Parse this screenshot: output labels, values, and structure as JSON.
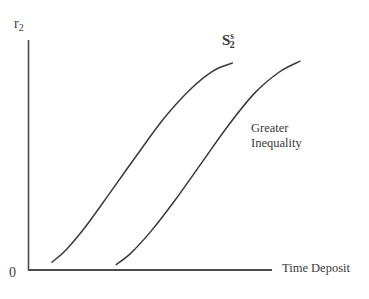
{
  "chart_data": {
    "type": "line",
    "title": "",
    "subtitle": "",
    "xlabel": "Time Deposit",
    "ylabel": "r",
    "ylabel_sub": "2",
    "origin_label": "0",
    "grid": false,
    "legend_position": "inline-annotation",
    "xlim": [
      0,
      100
    ],
    "ylim": [
      0,
      100
    ],
    "xticks": [],
    "yticks": [],
    "series": [
      {
        "name": "S",
        "name_sub": "2",
        "name_sup": "s",
        "label": "S2s",
        "color": "#3a3a3a",
        "points": [
          {
            "x": 8.2,
            "y": 3.5
          },
          {
            "x": 13.0,
            "y": 9.0
          },
          {
            "x": 20.0,
            "y": 20.0
          },
          {
            "x": 28.0,
            "y": 34.5
          },
          {
            "x": 37.0,
            "y": 51.0
          },
          {
            "x": 46.0,
            "y": 67.0
          },
          {
            "x": 55.0,
            "y": 80.0
          },
          {
            "x": 63.0,
            "y": 88.5
          },
          {
            "x": 69.5,
            "y": 92.0
          }
        ]
      },
      {
        "name": "Greater Inequality curve",
        "label": "Greater Inequality",
        "color": "#3a3a3a",
        "points": [
          {
            "x": 30.0,
            "y": 2.4
          },
          {
            "x": 35.0,
            "y": 7.5
          },
          {
            "x": 42.0,
            "y": 17.5
          },
          {
            "x": 50.0,
            "y": 31.0
          },
          {
            "x": 59.0,
            "y": 47.5
          },
          {
            "x": 68.0,
            "y": 64.0
          },
          {
            "x": 77.0,
            "y": 78.5
          },
          {
            "x": 85.5,
            "y": 88.0
          },
          {
            "x": 92.5,
            "y": 92.8
          }
        ]
      }
    ],
    "annotations": [
      {
        "name": "curve-label",
        "text_base": "S",
        "text_sub": "2",
        "text_sup": "s",
        "x": 70.5,
        "y": 96.0
      },
      {
        "name": "greater-inequality",
        "line1": "Greater",
        "line2": "Inequality",
        "x": 91.5,
        "y": 64.0
      }
    ],
    "colors": {
      "ink": "#3a3a3a",
      "axis": "#4a4a4a",
      "background": "#ffffff"
    }
  },
  "axes": {
    "y_label_base": "r",
    "y_label_sub": "2",
    "x_label": "Time Deposit",
    "origin": "0"
  },
  "curve_label": {
    "base": "S",
    "superscript": "s",
    "subscript": "2"
  },
  "annotation": {
    "line1": "Greater",
    "line2": "Inequality"
  }
}
